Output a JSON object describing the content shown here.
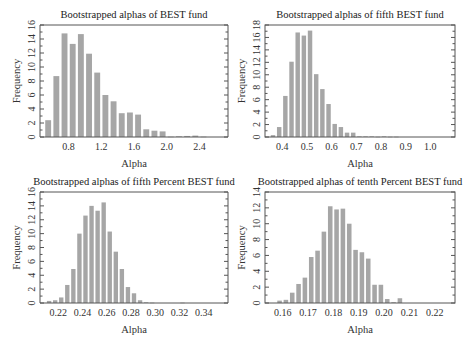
{
  "chart_data": [
    {
      "type": "bar",
      "title": "Bootstrapped alphas of BEST fund",
      "xlabel": "Alpha",
      "ylabel": "Frequency",
      "xlim": [
        0.45,
        2.75
      ],
      "ylim": [
        0,
        16
      ],
      "xticks": [
        "0.8",
        "1.2",
        "1.6",
        "2.0",
        "2.4"
      ],
      "xtick_values": [
        0.8,
        1.2,
        1.6,
        2.0,
        2.4
      ],
      "yticks": [
        0,
        2,
        4,
        6,
        8,
        10,
        12,
        14,
        16
      ],
      "bin_width": 0.1,
      "categories": [
        0.55,
        0.65,
        0.75,
        0.85,
        0.95,
        1.05,
        1.15,
        1.25,
        1.35,
        1.45,
        1.55,
        1.65,
        1.75,
        1.85,
        1.95,
        2.05,
        2.15,
        2.25,
        2.35,
        2.45
      ],
      "values": [
        2.4,
        8.7,
        14.8,
        13.3,
        14.7,
        11.9,
        9.2,
        6.0,
        5.1,
        3.4,
        3.5,
        3.2,
        1.1,
        0.9,
        0.8,
        0.05,
        0.1,
        0.15,
        0.2,
        0.05
      ],
      "open_left_axis": true
    },
    {
      "type": "bar",
      "title": "Bootstrapped alphas of fifth BEST fund",
      "xlabel": "Alpha",
      "ylabel": "Frequency",
      "xlim": [
        0.33,
        1.1
      ],
      "ylim": [
        0,
        18
      ],
      "xticks": [
        "0.4",
        "0.5",
        "0.6",
        "0.7",
        "0.8",
        "0.9",
        "1.0"
      ],
      "xtick_values": [
        0.4,
        0.5,
        0.6,
        0.7,
        0.8,
        0.9,
        1.0
      ],
      "yticks": [
        0,
        2,
        4,
        6,
        8,
        10,
        12,
        14,
        16,
        18
      ],
      "bin_width": 0.025,
      "categories": [
        0.3625,
        0.3875,
        0.4125,
        0.4375,
        0.4625,
        0.4875,
        0.5125,
        0.5375,
        0.5625,
        0.5875,
        0.6125,
        0.6375,
        0.6625,
        0.6875,
        0.7125,
        0.7375,
        0.7625,
        0.7875,
        0.8125,
        0.8375,
        0.8625,
        0.8875,
        0.9125,
        0.9375
      ],
      "values": [
        0.3,
        1.6,
        6.6,
        12.1,
        16.8,
        16.3,
        17.1,
        10.1,
        7.7,
        5.3,
        2.1,
        1.6,
        0.7,
        0.7,
        0.1,
        0.1,
        0.1,
        0.05,
        0.1,
        0.05,
        0.05,
        0.0,
        0.0,
        0.0
      ],
      "open_left_axis": false
    },
    {
      "type": "bar",
      "title": "Bootstrapped alphas of fifth Percent BEST fund",
      "xlabel": "Alpha",
      "ylabel": "Frequency",
      "xlim": [
        0.205,
        0.36
      ],
      "ylim": [
        0,
        16
      ],
      "xticks": [
        "0.22",
        "0.24",
        "0.26",
        "0.28",
        "0.30",
        "0.32",
        "0.34"
      ],
      "xtick_values": [
        0.22,
        0.24,
        0.26,
        0.28,
        0.3,
        0.32,
        0.34
      ],
      "yticks": [
        0,
        2,
        4,
        6,
        8,
        10,
        12,
        14,
        16
      ],
      "bin_width": 0.005,
      "categories": [
        0.2125,
        0.2175,
        0.2225,
        0.2275,
        0.2325,
        0.2375,
        0.2425,
        0.2475,
        0.2525,
        0.2575,
        0.2625,
        0.2675,
        0.2725,
        0.2775,
        0.2825,
        0.2875,
        0.2925,
        0.2975,
        0.3025,
        0.3075,
        0.3125,
        0.3175,
        0.3225,
        0.3275,
        0.3325
      ],
      "values": [
        0.3,
        0.4,
        0.8,
        2.6,
        4.9,
        10.0,
        12.6,
        14.0,
        13.3,
        14.5,
        10.3,
        7.4,
        4.9,
        2.3,
        1.4,
        0.4,
        0.1,
        0.05,
        0.0,
        0.0,
        0.0,
        0.0,
        0.05,
        0.0,
        0.0
      ],
      "open_left_axis": true
    },
    {
      "type": "bar",
      "title": "Bootstrapped alphas of tenth Percent BEST fund",
      "xlabel": "Alpha",
      "ylabel": "Frequency",
      "xlim": [
        0.153,
        0.228
      ],
      "ylim": [
        0,
        14
      ],
      "xticks": [
        "0.16",
        "0.17",
        "0.18",
        "0.19",
        "0.20",
        "0.21",
        "0.22"
      ],
      "xtick_values": [
        0.16,
        0.17,
        0.18,
        0.19,
        0.2,
        0.21,
        0.22
      ],
      "yticks": [
        0,
        2,
        4,
        6,
        8,
        10,
        12,
        14
      ],
      "bin_width": 0.0025,
      "categories": [
        0.15875,
        0.16125,
        0.16375,
        0.16625,
        0.16875,
        0.17125,
        0.17375,
        0.17625,
        0.17875,
        0.18125,
        0.18375,
        0.18625,
        0.18875,
        0.19125,
        0.19375,
        0.19625,
        0.19875,
        0.20125,
        0.20375,
        0.20625,
        0.20875,
        0.21125,
        0.21375,
        0.21625,
        0.21875
      ],
      "values": [
        0.3,
        0.4,
        1.3,
        2.4,
        3.2,
        5.8,
        6.6,
        9.0,
        12.2,
        11.8,
        11.9,
        10.0,
        6.7,
        6.4,
        5.6,
        2.3,
        2.3,
        0.5,
        0.1,
        0.6,
        0.0,
        0.0,
        0.0,
        0.0,
        0.0
      ],
      "open_left_axis": false
    }
  ]
}
